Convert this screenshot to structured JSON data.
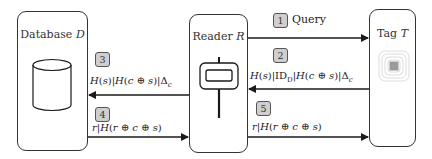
{
  "diagram": {
    "type": "protocol-sequence",
    "entities": [
      {
        "id": "database",
        "label": "Database",
        "symbol": "D",
        "icon": "database-cylinder-icon"
      },
      {
        "id": "reader",
        "label": "Reader",
        "symbol": "R",
        "icon": "rfid-reader-icon"
      },
      {
        "id": "tag",
        "label": "Tag",
        "symbol": "T",
        "icon": "rfid-tag-icon"
      }
    ],
    "messages": [
      {
        "step": "1",
        "from": "reader",
        "to": "tag",
        "text": "Query"
      },
      {
        "step": "2",
        "from": "tag",
        "to": "reader",
        "text": "H(s)|ID_D|H(c ⊕ s)|Δ_c"
      },
      {
        "step": "3",
        "from": "reader",
        "to": "database",
        "text": "H(s)|H(c ⊕ s)|Δ_c"
      },
      {
        "step": "4",
        "from": "database",
        "to": "reader",
        "text": "r|H(r ⊕ c ⊕ s)"
      },
      {
        "step": "5",
        "from": "reader",
        "to": "tag",
        "text": "r|H(r ⊕ c ⊕ s)"
      }
    ],
    "colors": {
      "line": "#1a1a1a",
      "badge_fill": "#cfcfcf",
      "badge_border": "#555555",
      "tag_chip": "#9a9a9a",
      "tag_rings": "#d8d8d8"
    }
  }
}
